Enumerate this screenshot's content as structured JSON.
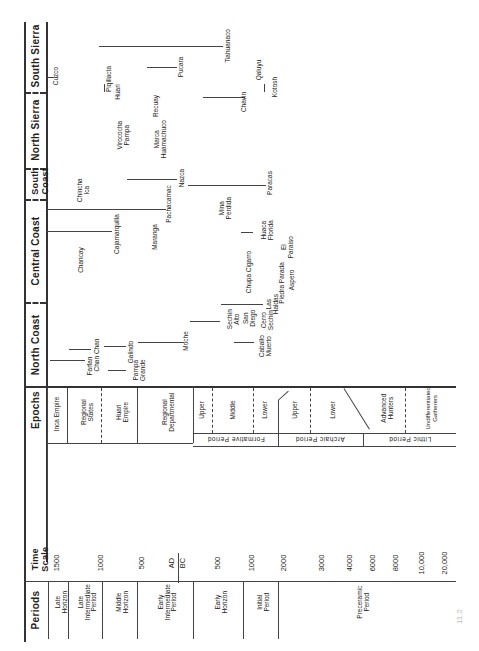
{
  "chart_title": "Andean chronological chart (rotated)",
  "regions": [
    {
      "key": "south_sierra",
      "label": "South Sierra"
    },
    {
      "key": "north_sierra",
      "label": "North Sierra"
    },
    {
      "key": "south_coast",
      "label": "South Coast"
    },
    {
      "key": "central_coast",
      "label": "Central Coast"
    },
    {
      "key": "north_coast",
      "label": "North Coast"
    }
  ],
  "sites": {
    "south_sierra": [
      "Cuzco",
      "Piqillacta",
      "Huari",
      "Tiahuanaco",
      "Pucara",
      "Qaluyu"
    ],
    "north_sierra": [
      "Virococha Pampa",
      "Marca Huamachuco",
      "Recuay",
      "Chavin",
      "Kotosh"
    ],
    "south_coast": [
      "Chincha Ica",
      "Nazca",
      "Paracas"
    ],
    "central_coast": [
      "Chancay",
      "Cajamarquilla",
      "Maranga",
      "Pachacamac",
      "Mina Perdida",
      "Huaca Florida",
      "El Paraiso",
      "Chupa Cigarro",
      "Piedra Parada",
      "Aspero"
    ],
    "north_coast": [
      "Farfan",
      "Chan Chan",
      "Pampa Grande",
      "Galindo",
      "Moche",
      "Sechin Alto",
      "San Diego",
      "Cerro Sechin",
      "Las Haldas",
      "Caballo Muerto"
    ]
  },
  "labels": {
    "epochs_header": "Epochs",
    "time_scale_header": "Time Scale",
    "periods_header": "Periods"
  },
  "epochs": [
    {
      "label": "Inca Empire"
    },
    {
      "label": "Regional States"
    },
    {
      "label": "Huari Empire"
    },
    {
      "label": "Regional Departmental"
    },
    {
      "label": "Upper"
    },
    {
      "label": "Middle"
    },
    {
      "label": "Lower"
    },
    {
      "label": "Upper"
    },
    {
      "label": "Lower"
    },
    {
      "label": "Advanced Hunters"
    },
    {
      "label": "Undifferentiated Gatherers"
    }
  ],
  "epoch_groups": [
    {
      "label": "Formative Period"
    },
    {
      "label": "Archaic Period"
    },
    {
      "label": "Lithic Period"
    }
  ],
  "time_scale": [
    "1500",
    "1000",
    "500",
    "AD",
    "BC",
    "500",
    "1000",
    "2000",
    "3000",
    "4000",
    "6000",
    "8000",
    "10,000",
    "20,000"
  ],
  "periods": [
    {
      "label": "Late Horizon"
    },
    {
      "label": "Late Intermediate Period"
    },
    {
      "label": "Middle Horizon"
    },
    {
      "label": "Early Intermediate Period"
    },
    {
      "label": "Early Horizon"
    },
    {
      "label": "Initial Period"
    },
    {
      "label": "Preceramic Period"
    }
  ],
  "caption": "11.2"
}
